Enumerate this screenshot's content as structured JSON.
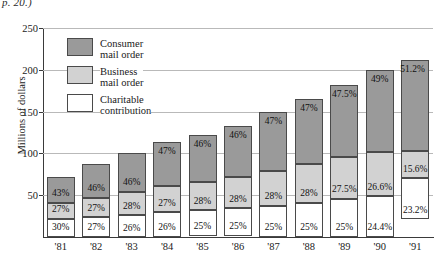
{
  "caption": "p. 20.)",
  "chart_data": {
    "type": "bar",
    "subtype": "stacked-bar-100-percent-annotated",
    "title": "",
    "xlabel": "",
    "ylabel": "Millions of dollars",
    "categories": [
      "'81",
      "'82",
      "'83",
      "'84",
      "'85",
      "'86",
      "'87",
      "'88",
      "'89",
      "'90",
      "'91"
    ],
    "ylim": [
      0,
      250
    ],
    "yticks": [
      50,
      100,
      150,
      200,
      250
    ],
    "grid": true,
    "legend_position": "inside-upper-left",
    "totals": [
      72,
      87,
      100,
      114,
      122,
      133,
      149,
      165,
      182,
      200,
      212
    ],
    "series": [
      {
        "name": "Consumer mail order",
        "color": "#9a9a9a",
        "labels": [
          "43%",
          "46%",
          "46%",
          "47%",
          "46%",
          "46%",
          "47%",
          "47%",
          "47.5%",
          "49%",
          "51.2%"
        ],
        "values": [
          43,
          46,
          46,
          47,
          46,
          46,
          47,
          47,
          47.5,
          49,
          51.2
        ]
      },
      {
        "name": "Business mail order",
        "color": "#d2d2d2",
        "labels": [
          "27%",
          "27%",
          "28%",
          "27%",
          "28%",
          "28%",
          "28%",
          "28%",
          "27.5%",
          "26.6%",
          "15.6%"
        ],
        "values": [
          27,
          27,
          28,
          27,
          28,
          28,
          28,
          28,
          27.5,
          26.6,
          15.6
        ]
      },
      {
        "name": "Charitable contribution",
        "color": "#ffffff",
        "labels": [
          "30%",
          "27%",
          "26%",
          "26%",
          "25%",
          "25%",
          "25%",
          "25%",
          "25%",
          "24.4%",
          "23.2%"
        ],
        "values": [
          30,
          27,
          26,
          26,
          25,
          25,
          25,
          25,
          25,
          24.4,
          23.2
        ]
      }
    ]
  },
  "legend": [
    {
      "swatch": "consumer",
      "line1": "Consumer",
      "line2": "mail order"
    },
    {
      "swatch": "business",
      "line1": "Business",
      "line2": "mail order"
    },
    {
      "swatch": "charity",
      "line1": "Charitable",
      "line2": "contribution"
    }
  ]
}
